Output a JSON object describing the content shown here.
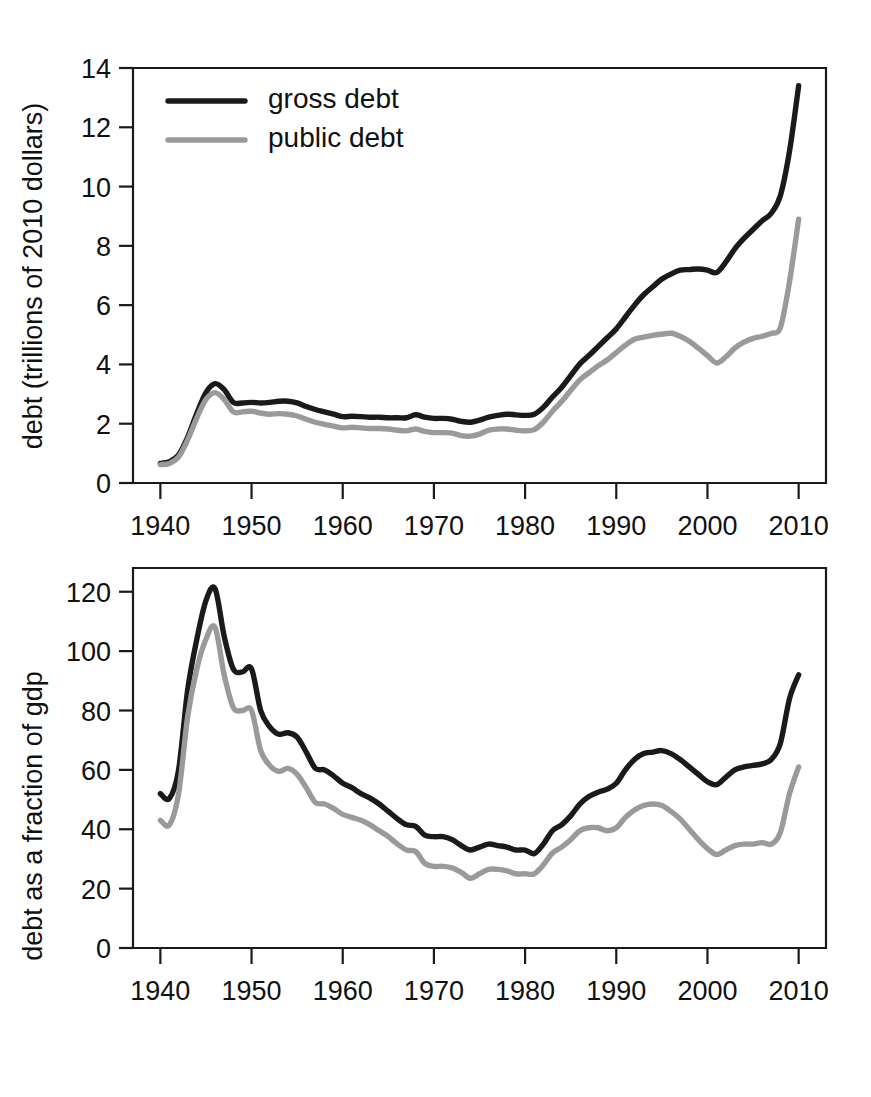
{
  "figure": {
    "width": 871,
    "height": 1097,
    "background": "#ffffff",
    "gross_color": "#1a1a1a",
    "public_color": "#9a9a9a"
  },
  "legend": {
    "gross_label": "gross debt",
    "public_label": "public debt"
  },
  "chart_data": [
    {
      "type": "line",
      "panel": "top",
      "title": "",
      "xlabel": "",
      "ylabel": "debt (trillions of 2010 dollars)",
      "xlim": [
        1937,
        2013
      ],
      "ylim": [
        0,
        14
      ],
      "xticks": [
        1940,
        1950,
        1960,
        1970,
        1980,
        1990,
        2000,
        2010
      ],
      "yticks": [
        0,
        2,
        4,
        6,
        8,
        10,
        12,
        14
      ],
      "xticklabels": [
        "1940",
        "1950",
        "1960",
        "1970",
        "1980",
        "1990",
        "2000",
        "2010"
      ],
      "yticklabels": [
        "0",
        "2",
        "4",
        "6",
        "8",
        "10",
        "12",
        "14"
      ],
      "grid": false,
      "legend_position": "upper left",
      "x": [
        1940,
        1941,
        1942,
        1943,
        1944,
        1945,
        1946,
        1947,
        1948,
        1949,
        1950,
        1951,
        1952,
        1953,
        1954,
        1955,
        1956,
        1957,
        1958,
        1959,
        1960,
        1961,
        1962,
        1963,
        1964,
        1965,
        1966,
        1967,
        1968,
        1969,
        1970,
        1971,
        1972,
        1973,
        1974,
        1975,
        1976,
        1977,
        1978,
        1979,
        1980,
        1981,
        1982,
        1983,
        1984,
        1985,
        1986,
        1987,
        1988,
        1989,
        1990,
        1991,
        1992,
        1993,
        1994,
        1995,
        1996,
        1997,
        1998,
        1999,
        2000,
        2001,
        2002,
        2003,
        2004,
        2005,
        2006,
        2007,
        2008,
        2009,
        2010
      ],
      "series": [
        {
          "name": "gross debt",
          "color": "#1a1a1a",
          "values": [
            0.66,
            0.72,
            0.95,
            1.55,
            2.35,
            3.05,
            3.35,
            3.15,
            2.72,
            2.7,
            2.72,
            2.7,
            2.72,
            2.76,
            2.76,
            2.7,
            2.58,
            2.48,
            2.4,
            2.32,
            2.24,
            2.25,
            2.24,
            2.22,
            2.22,
            2.2,
            2.2,
            2.2,
            2.3,
            2.22,
            2.18,
            2.18,
            2.15,
            2.08,
            2.05,
            2.12,
            2.22,
            2.28,
            2.32,
            2.3,
            2.28,
            2.32,
            2.55,
            2.9,
            3.22,
            3.62,
            4.02,
            4.3,
            4.6,
            4.9,
            5.2,
            5.6,
            6.0,
            6.35,
            6.62,
            6.88,
            7.05,
            7.18,
            7.2,
            7.22,
            7.18,
            7.1,
            7.45,
            7.9,
            8.25,
            8.55,
            8.85,
            9.1,
            9.7,
            11.2,
            13.4
          ]
        },
        {
          "name": "public debt",
          "color": "#9a9a9a",
          "values": [
            0.62,
            0.66,
            0.88,
            1.46,
            2.2,
            2.82,
            3.05,
            2.82,
            2.4,
            2.4,
            2.42,
            2.36,
            2.32,
            2.34,
            2.32,
            2.26,
            2.15,
            2.05,
            1.98,
            1.92,
            1.86,
            1.88,
            1.86,
            1.84,
            1.84,
            1.82,
            1.78,
            1.76,
            1.82,
            1.74,
            1.7,
            1.7,
            1.68,
            1.6,
            1.58,
            1.65,
            1.78,
            1.82,
            1.82,
            1.78,
            1.76,
            1.8,
            2.05,
            2.42,
            2.75,
            3.12,
            3.48,
            3.72,
            3.95,
            4.15,
            4.4,
            4.65,
            4.85,
            4.92,
            4.98,
            5.02,
            5.05,
            4.95,
            4.78,
            4.55,
            4.3,
            4.05,
            4.25,
            4.55,
            4.75,
            4.88,
            4.95,
            5.05,
            5.25,
            6.8,
            8.9
          ]
        }
      ]
    },
    {
      "type": "line",
      "panel": "bottom",
      "title": "",
      "xlabel": "",
      "ylabel": "debt as a fraction of gdp",
      "xlim": [
        1937,
        2013
      ],
      "ylim": [
        0,
        128
      ],
      "xticks": [
        1940,
        1950,
        1960,
        1970,
        1980,
        1990,
        2000,
        2010
      ],
      "yticks": [
        0,
        20,
        40,
        60,
        80,
        100,
        120
      ],
      "xticklabels": [
        "1940",
        "1950",
        "1960",
        "1970",
        "1980",
        "1990",
        "2000",
        "2010"
      ],
      "yticklabels": [
        "0",
        "20",
        "40",
        "60",
        "80",
        "100",
        "120"
      ],
      "grid": false,
      "legend_position": "none",
      "x": [
        1940,
        1941,
        1942,
        1943,
        1944,
        1945,
        1946,
        1947,
        1948,
        1949,
        1950,
        1951,
        1952,
        1953,
        1954,
        1955,
        1956,
        1957,
        1958,
        1959,
        1960,
        1961,
        1962,
        1963,
        1964,
        1965,
        1966,
        1967,
        1968,
        1969,
        1970,
        1971,
        1972,
        1973,
        1974,
        1975,
        1976,
        1977,
        1978,
        1979,
        1980,
        1981,
        1982,
        1983,
        1984,
        1985,
        1986,
        1987,
        1988,
        1989,
        1990,
        1991,
        1992,
        1993,
        1994,
        1995,
        1996,
        1997,
        1998,
        1999,
        2000,
        2001,
        2002,
        2003,
        2004,
        2005,
        2006,
        2007,
        2008,
        2009,
        2010
      ],
      "series": [
        {
          "name": "gross debt",
          "color": "#1a1a1a",
          "values": [
            52.0,
            50.4,
            60.0,
            87.0,
            104.0,
            117.0,
            121.0,
            105.0,
            94.0,
            93.0,
            94.0,
            80.0,
            74.5,
            72.0,
            72.5,
            71.0,
            66.0,
            60.5,
            60.0,
            58.0,
            55.5,
            54.0,
            52.0,
            50.5,
            48.5,
            46.0,
            43.5,
            41.5,
            41.0,
            38.0,
            37.5,
            37.5,
            36.5,
            34.5,
            33.0,
            34.0,
            35.0,
            34.5,
            34.0,
            33.0,
            33.0,
            31.8,
            35.0,
            39.5,
            41.5,
            44.5,
            48.5,
            51.0,
            52.5,
            53.5,
            55.5,
            60.0,
            63.5,
            65.5,
            66.0,
            66.5,
            65.5,
            63.5,
            61.0,
            58.5,
            56.0,
            55.0,
            57.5,
            60.0,
            61.0,
            61.5,
            62.0,
            63.5,
            69.0,
            84.0,
            92.0
          ]
        },
        {
          "name": "public debt",
          "color": "#9a9a9a",
          "values": [
            43.0,
            41.5,
            52.0,
            78.0,
            94.0,
            104.0,
            108.0,
            92.0,
            81.0,
            80.0,
            80.0,
            66.5,
            61.5,
            59.5,
            60.5,
            58.5,
            54.0,
            49.0,
            48.5,
            47.0,
            45.0,
            44.0,
            43.0,
            41.5,
            39.5,
            37.5,
            35.0,
            33.0,
            32.5,
            28.5,
            27.5,
            27.5,
            27.0,
            25.5,
            23.5,
            25.0,
            26.5,
            26.5,
            26.0,
            25.0,
            25.0,
            25.0,
            28.0,
            32.0,
            34.0,
            36.5,
            39.5,
            40.5,
            40.5,
            39.5,
            40.5,
            44.0,
            46.5,
            48.0,
            48.5,
            48.0,
            46.0,
            43.5,
            40.0,
            36.5,
            33.5,
            31.5,
            33.0,
            34.5,
            35.0,
            35.0,
            35.5,
            35.0,
            39.0,
            52.0,
            61.0
          ]
        }
      ]
    }
  ]
}
